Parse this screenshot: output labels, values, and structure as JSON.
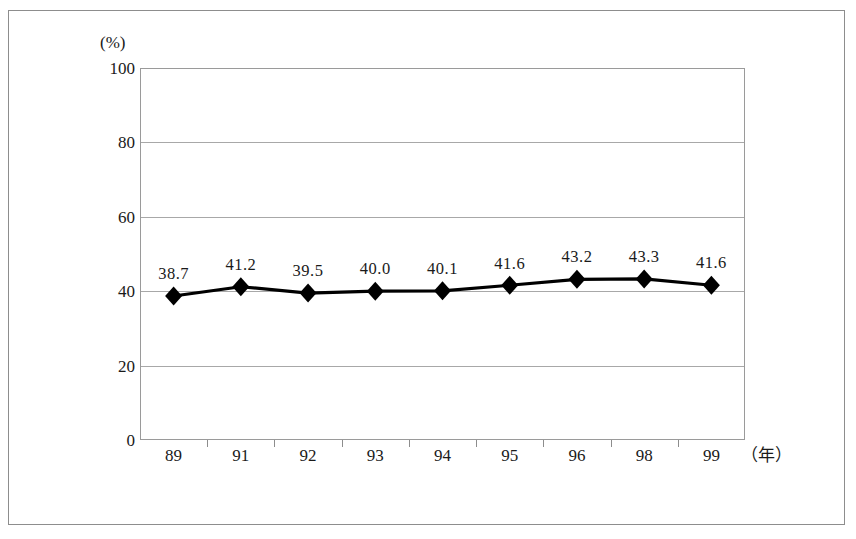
{
  "chart_data": {
    "type": "line",
    "title": "",
    "subtitle": "",
    "xlabel": "（年）",
    "ylabel": "(%)",
    "categories": [
      "89",
      "91",
      "92",
      "93",
      "94",
      "95",
      "96",
      "98",
      "99"
    ],
    "values": [
      38.7,
      41.2,
      39.5,
      40.0,
      40.1,
      41.6,
      43.2,
      43.3,
      41.6
    ],
    "point_labels": [
      "38.7",
      "41.2",
      "39.5",
      "40.0",
      "40.1",
      "41.6",
      "43.2",
      "43.3",
      "41.6"
    ],
    "series": [
      {
        "name": "",
        "values": [
          38.7,
          41.2,
          39.5,
          40.0,
          40.1,
          41.6,
          43.2,
          43.3,
          41.6
        ],
        "marker": "diamond",
        "color": "#000000"
      }
    ],
    "ylim": [
      0,
      100
    ],
    "yticks": [
      0,
      20,
      40,
      60,
      80,
      100
    ],
    "ytick_labels": [
      "0",
      "20",
      "40",
      "60",
      "80",
      "100"
    ],
    "grid": true,
    "grid_axis": "y",
    "legend": "none",
    "colors": {
      "line": "#000000",
      "marker": "#000000",
      "grid": "#a8a8a8",
      "axis": "#9a9a9a",
      "frame": "#8d8d8d",
      "text": "#1a1a1a",
      "background": "#ffffff"
    }
  },
  "axis": {
    "y_unit": "(%)",
    "x_unit": "（年）"
  }
}
